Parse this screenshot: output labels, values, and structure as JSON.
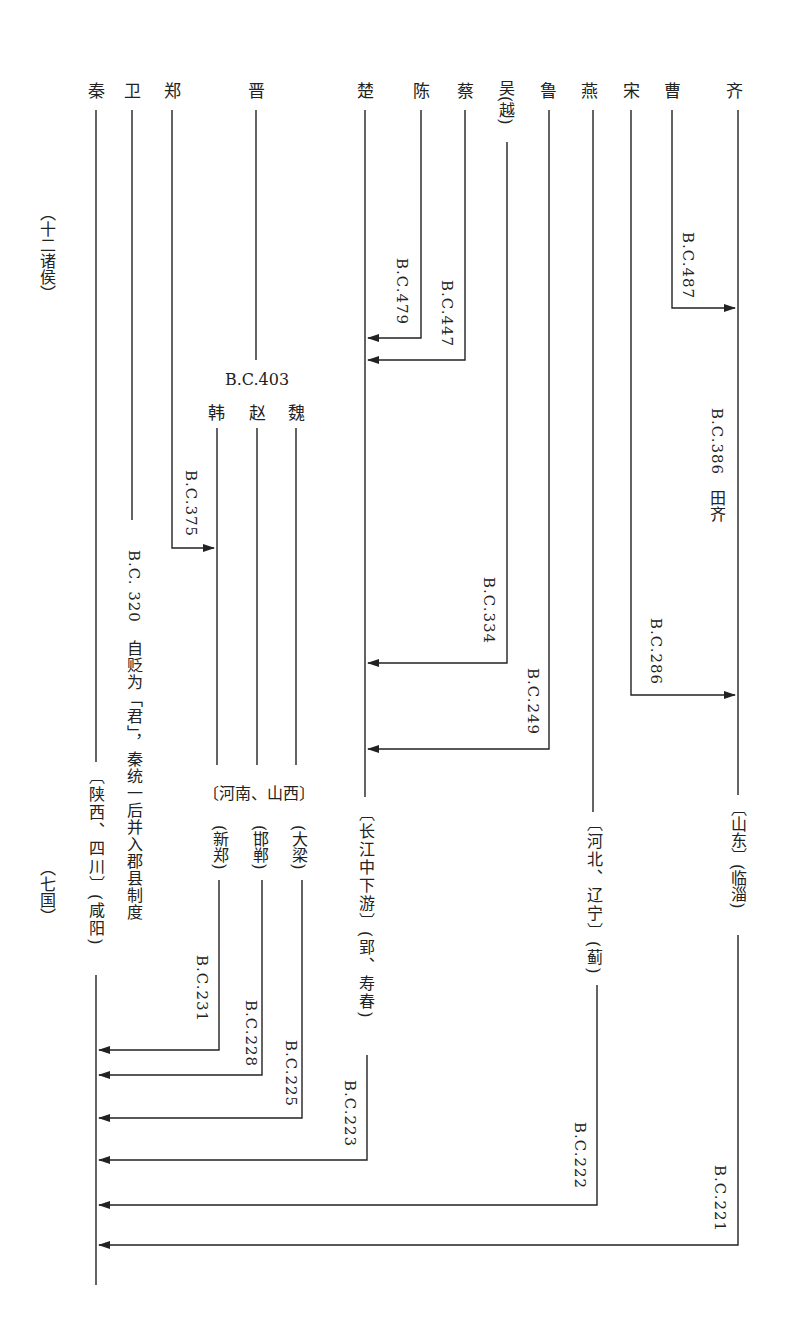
{
  "diagram": {
    "colors": {
      "line": "#222222",
      "background": "#ffffff"
    },
    "period_labels": {
      "top": "（十二诸侯）",
      "bottom": "（七国）"
    },
    "states_top": [
      {
        "name": "秦",
        "x": 96
      },
      {
        "name": "卫",
        "x": 132
      },
      {
        "name": "郑",
        "x": 172
      },
      {
        "name": "晋",
        "x": 256
      },
      {
        "name": "楚",
        "x": 365
      },
      {
        "name": "陈",
        "x": 421
      },
      {
        "name": "蔡",
        "x": 465
      },
      {
        "name": "吴(越)",
        "x": 506
      },
      {
        "name": "鲁",
        "x": 548
      },
      {
        "name": "燕",
        "x": 589
      },
      {
        "name": "宋",
        "x": 631
      },
      {
        "name": "曹",
        "x": 672
      },
      {
        "name": "齐",
        "x": 734
      }
    ],
    "partition": {
      "date": "B.C.403",
      "states": [
        "韩",
        "赵",
        "魏"
      ]
    },
    "events": [
      {
        "from": "曹",
        "to": "齐",
        "date": "B.C.487"
      },
      {
        "from": "陈",
        "to": "楚",
        "date": "B.C.479"
      },
      {
        "from": "蔡",
        "to": "楚",
        "date": "B.C.447"
      },
      {
        "from": "齐",
        "date": "B.C.386",
        "note": "田齐"
      },
      {
        "from": "郑",
        "to": "韩",
        "date": "B.C.375"
      },
      {
        "from": "卫",
        "date": "B.C. 320",
        "note": "自贬为「君」，秦统一后并入郡县制度"
      },
      {
        "from": "吴(越)",
        "to": "楚",
        "date": "B.C.334"
      },
      {
        "from": "宋",
        "to": "齐",
        "date": "B.C.286"
      },
      {
        "from": "鲁",
        "to": "楚",
        "date": "B.C.249"
      },
      {
        "from": "韩",
        "to": "秦",
        "date": "B.C.231"
      },
      {
        "from": "赵",
        "to": "秦",
        "date": "B.C.228"
      },
      {
        "from": "魏",
        "to": "秦",
        "date": "B.C.225"
      },
      {
        "from": "楚",
        "to": "秦",
        "date": "B.C.223"
      },
      {
        "from": "燕",
        "to": "秦",
        "date": "B.C.222"
      },
      {
        "from": "齐",
        "to": "秦",
        "date": "B.C.221"
      }
    ],
    "regions": {
      "qin": {
        "region": "〔陕西、四川〕",
        "capital": "(咸阳)"
      },
      "sanjin": {
        "region": "〔河南、山西〕"
      },
      "han_capital": "(新郑)",
      "zhao_capital": "(邯郸)",
      "wei_capital": "(大梁)",
      "chu": {
        "region": "〔长江中下游〕",
        "capital": "(郢、寿春)"
      },
      "yan": {
        "region": "〔河北、辽宁〕",
        "capital": "(蓟)"
      },
      "qi": {
        "region": "〔山东〕",
        "capital": "(临淄)"
      }
    }
  }
}
